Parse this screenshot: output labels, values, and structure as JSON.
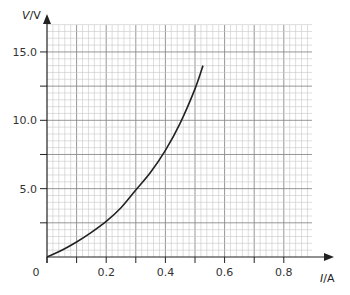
{
  "chart_data": {
    "type": "line",
    "title": "",
    "xlabel": "I/A",
    "ylabel": "V/V",
    "xlabel_parts": {
      "var": "I",
      "unit": "/A"
    },
    "ylabel_parts": {
      "var": "V",
      "unit": "/V"
    },
    "xlim": [
      0,
      0.9
    ],
    "ylim": [
      0,
      17.5
    ],
    "x_ticks": [
      0.1,
      0.2,
      0.3,
      0.4,
      0.5,
      0.6,
      0.7,
      0.8
    ],
    "x_tick_labels": [
      {
        "value": 0,
        "label": "0"
      },
      {
        "value": 0.2,
        "label": "0.2"
      },
      {
        "value": 0.4,
        "label": "0.4"
      },
      {
        "value": 0.6,
        "label": "0.6"
      },
      {
        "value": 0.8,
        "label": "0.8"
      }
    ],
    "y_ticks": [
      2.5,
      5.0,
      7.5,
      10.0,
      12.5,
      15.0
    ],
    "y_tick_labels": [
      {
        "value": 5.0,
        "label": "5.0"
      },
      {
        "value": 10.0,
        "label": "10.0"
      },
      {
        "value": 15.0,
        "label": "15.0"
      }
    ],
    "grid": true,
    "grid_minor_x": 0.02,
    "grid_minor_y": 0.5,
    "grid_major_x": 0.1,
    "grid_major_y": 2.5,
    "legend": null,
    "series": [
      {
        "name": "V-I characteristic",
        "color": "#222222",
        "x": [
          0.0,
          0.05,
          0.1,
          0.15,
          0.2,
          0.25,
          0.3,
          0.35,
          0.4,
          0.45,
          0.5,
          0.527
        ],
        "y": [
          0.0,
          0.5,
          1.1,
          1.8,
          2.6,
          3.6,
          4.9,
          6.2,
          7.8,
          9.8,
          12.3,
          14.0
        ]
      }
    ]
  },
  "colors": {
    "grid_minor": "#c8c8c8",
    "grid_major": "#8a8a8a",
    "axis": "#222222",
    "curve": "#222222"
  }
}
